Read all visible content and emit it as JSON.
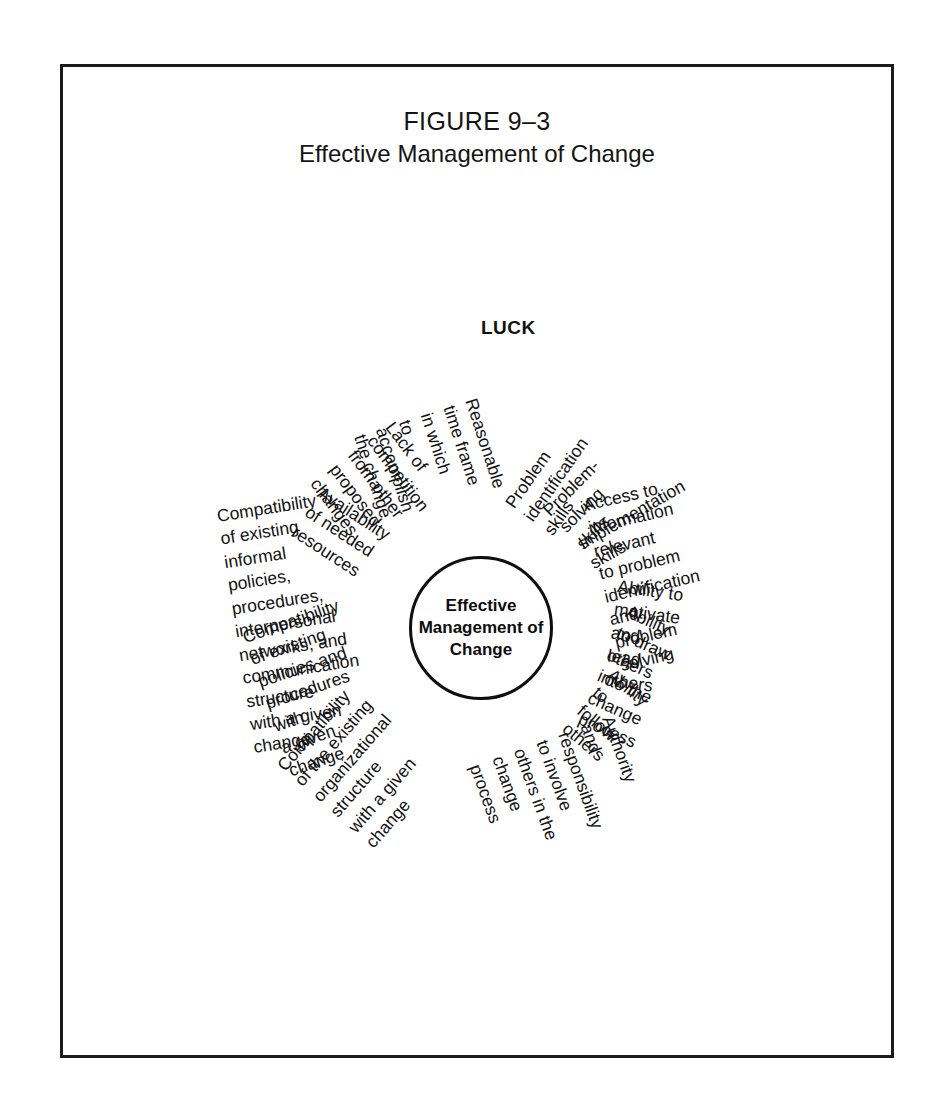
{
  "figure": {
    "number": "FIGURE 9–3",
    "title": "Effective Management of Change"
  },
  "hub": {
    "label": "Effective\nManagement of\nChange"
  },
  "diagram": {
    "type": "radial-spoke",
    "center_label": "Effective Management of Change",
    "spoke_count": 15,
    "spokes": [
      {
        "id": "luck",
        "label": "LUCK",
        "bold": true,
        "angle_deg": -90,
        "radius": 300,
        "side": "left",
        "rotation_deg": 0
      },
      {
        "id": "problem-identification-skills",
        "label": "Problem identification skills",
        "bold": false,
        "angle_deg": -66,
        "radius": 118,
        "side": "left",
        "rotation_deg": -55
      },
      {
        "id": "problem-solving-skills",
        "label": "Problem-solving skills",
        "bold": false,
        "angle_deg": -50,
        "radius": 128,
        "side": "left",
        "rotation_deg": -45
      },
      {
        "id": "implementation-skills",
        "label": "Implementation skills",
        "bold": false,
        "angle_deg": -35,
        "radius": 128,
        "side": "left",
        "rotation_deg": -30
      },
      {
        "id": "access-to-information",
        "label": "Access to information relevant\nto problem identification and\nproblem solving",
        "bold": false,
        "angle_deg": -19,
        "radius": 128,
        "side": "left",
        "rotation_deg": -13
      },
      {
        "id": "ability-to-motivate-and-lead",
        "label": "Ability to motivate and lead\nothers",
        "bold": false,
        "angle_deg": 2,
        "radius": 130,
        "side": "left",
        "rotation_deg": 8
      },
      {
        "id": "ability-to-draw-others",
        "label": "Ability to draw others\ninto the change process",
        "bold": false,
        "angle_deg": 17,
        "radius": 128,
        "side": "left",
        "rotation_deg": 24
      },
      {
        "id": "ability-to-follow-others",
        "label": "Ability to follow others",
        "bold": false,
        "angle_deg": 34,
        "radius": 128,
        "side": "left",
        "rotation_deg": 40
      },
      {
        "id": "authority-and-responsibility",
        "label": "Authority and responsibility\nto involve others in the\nchange process",
        "bold": false,
        "angle_deg": 62,
        "radius": 128,
        "side": "left",
        "rotation_deg": 70
      },
      {
        "id": "compatibility-organizational-structure",
        "label": "Compatibility of the existing\norganizational structure\nwith a given change",
        "bold": false,
        "angle_deg": 131,
        "radius": 128,
        "side": "right",
        "rotation_deg": -49
      },
      {
        "id": "compatibility-policies-procedures",
        "label": "Compatibility of existing\npolicies and procedures with\na given change",
        "bold": false,
        "angle_deg": 160,
        "radius": 128,
        "side": "right",
        "rotation_deg": -19
      },
      {
        "id": "compatibility-informal-policies",
        "label": "Compatibility of existing\ninformal policies, procedures,\ninterpersonal networks, and\ncommunication structure\nwith a given change",
        "bold": false,
        "angle_deg": -174,
        "radius": 130,
        "side": "right",
        "rotation_deg": -9
      },
      {
        "id": "availability-of-needed-resources",
        "label": "Availability of needed resources",
        "bold": false,
        "angle_deg": -146,
        "radius": 128,
        "side": "right",
        "rotation_deg": 33
      },
      {
        "id": "lack-of-competition",
        "label": "Lack of competition from other\nproposed changes",
        "bold": false,
        "angle_deg": -126,
        "radius": 128,
        "side": "right",
        "rotation_deg": 53
      },
      {
        "id": "reasonable-time-frame",
        "label": "Reasonable time frame in which\nto accomplish the change",
        "bold": false,
        "angle_deg": -107,
        "radius": 128,
        "side": "right",
        "rotation_deg": 72
      }
    ]
  },
  "colors": {
    "ink": "#111111",
    "frame": "#1b1b1b",
    "background": "#ffffff"
  }
}
